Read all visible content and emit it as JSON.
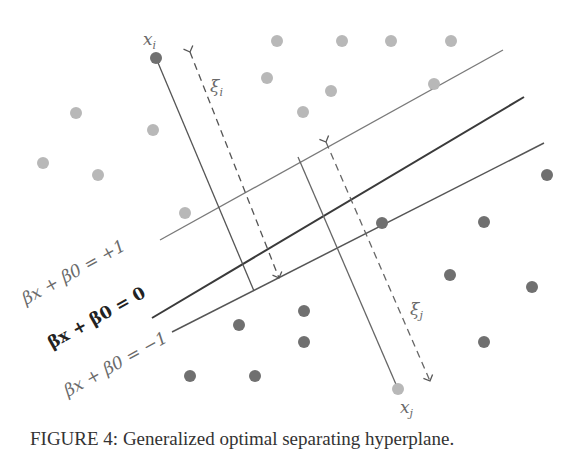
{
  "figure": {
    "caption": "FIGURE 4: Generalized optimal separating hyperplane.",
    "colors": {
      "light_class": "#b8b8b8",
      "dark_class": "#707070",
      "margin_line": "#7a7a7a",
      "hyperplane": "#3a3a3a",
      "label_margin": "#6a6a6a",
      "label_hyperplane": "#222222"
    },
    "labels": {
      "plus_margin": "βx + β0 = +1",
      "hyperplane": "βx + β0 = 0",
      "minus_margin": "βx + β0 = −1",
      "xi_point": "x",
      "xi_sub": "i",
      "xj_point": "x",
      "xj_sub": "j",
      "slack_i": "ξ",
      "slack_i_sub": "i",
      "slack_j": "ξ",
      "slack_j_sub": "j"
    },
    "light_points": [
      [
        277,
        41
      ],
      [
        342,
        41
      ],
      [
        391,
        41
      ],
      [
        451,
        41
      ],
      [
        267,
        78
      ],
      [
        331,
        91
      ],
      [
        303,
        112
      ],
      [
        434,
        84
      ],
      [
        76,
        113
      ],
      [
        153,
        130
      ],
      [
        43,
        163
      ],
      [
        98,
        175
      ],
      [
        185,
        213
      ]
    ],
    "dark_points": [
      [
        156,
        58
      ],
      [
        547,
        175
      ],
      [
        382,
        223
      ],
      [
        484,
        222
      ],
      [
        450,
        275
      ],
      [
        532,
        287
      ],
      [
        239,
        325
      ],
      [
        304,
        311
      ],
      [
        304,
        342
      ],
      [
        484,
        342
      ],
      [
        190,
        376
      ],
      [
        255,
        376
      ]
    ],
    "outlier_points": {
      "xi": [
        156,
        58
      ],
      "xj": [
        398,
        389
      ]
    }
  }
}
